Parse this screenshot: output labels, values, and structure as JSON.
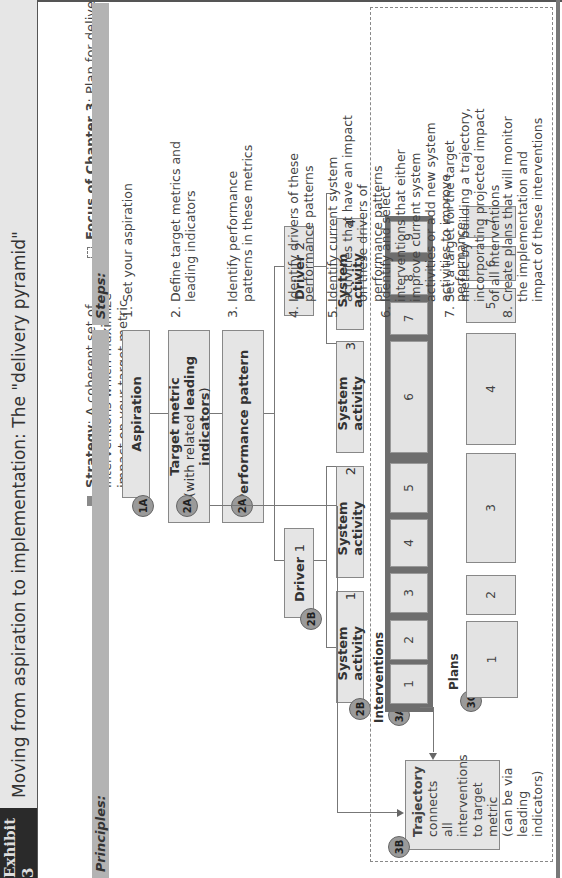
{
  "header": {
    "exhibit_label": "Exhibit 3",
    "title": "Moving from aspiration to implementation: The \"delivery pyramid\""
  },
  "legend": {
    "strategy_bold": "Strategy",
    "strategy_text": ": A coherent set of interventions which maximize impact on your target metric",
    "focus_bold": "Focus of Chapter 3",
    "focus_text": ": Plan for delivery"
  },
  "columns": {
    "principles_header": "Principles:",
    "steps_header": "Steps:"
  },
  "pyramid": {
    "aspiration": {
      "badge": "1A",
      "label": "Aspiration"
    },
    "target_metric": {
      "badge": "2A",
      "line1": "Target metric",
      "line2_pre": "(with related ",
      "line2_bold": "leading indicators",
      "line2_post": ")"
    },
    "performance_pattern": {
      "badge": "2A",
      "label": "Performance pattern"
    },
    "drivers": [
      {
        "badge": "2B",
        "label": "Driver",
        "num": "1"
      },
      {
        "label": "Driver",
        "num": "2"
      }
    ],
    "system_activities": [
      {
        "badge": "2B",
        "label": "System activity",
        "num": "1"
      },
      {
        "label": "System activity",
        "num": "2"
      },
      {
        "label": "System activity",
        "num": "3"
      },
      {
        "label": "System activity",
        "num": "4"
      }
    ],
    "interventions": {
      "badge": "3A",
      "label": "Interventions",
      "items": [
        "1",
        "2",
        "3",
        "4",
        "5",
        "6",
        "7",
        "8",
        "9"
      ]
    },
    "trajectory": {
      "badge": "3B",
      "bold": "Trajectory",
      "text": "connects all interventions to target metric (can be via leading indicators)"
    },
    "plans": {
      "badge": "3C",
      "label": "Plans",
      "items": [
        "1",
        "2",
        "3",
        "4",
        "5",
        "6",
        "7"
      ]
    }
  },
  "steps": [
    "1. Set your aspiration",
    "2. Define target metrics and leading indicators",
    "3. Identify performance patterns in these metrics",
    "4. Identify drivers of these performance patterns",
    "5. Identify current system activities that have an impact on these drivers of performance patterns",
    "6. Identify and select interventions that either improve current system activities or add new system activities to improve performance",
    "7. Set a target for the target metric by building a trajectory, incorporating projected impact of all interventions",
    "8. Create plans that will monitor the implementation and impact of these interventions"
  ],
  "colors": {
    "header_bar": "#b3b3b3",
    "box_fill": "#e5e5e5",
    "badge_fill": "#9a9a9a",
    "strategy_bar": "#6e6e6e",
    "exhibit_tag": "#2a2a2a"
  }
}
